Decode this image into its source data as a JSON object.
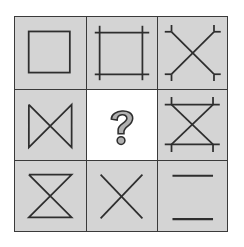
{
  "puzzle": {
    "type": "3x3 matrix reasoning",
    "colors": {
      "cell_bg": "#d4d4d4",
      "blank_bg": "#ffffff",
      "stroke": "#2e2e2e",
      "grid_line": "#3a3a3a",
      "qmark_fill": "#b0b0b0"
    },
    "cells": [
      {
        "row": 1,
        "col": 1,
        "figure": "square"
      },
      {
        "row": 1,
        "col": 2,
        "figure": "square-with-extended-sides"
      },
      {
        "row": 1,
        "col": 3,
        "figure": "x-with-forked-ends"
      },
      {
        "row": 2,
        "col": 1,
        "figure": "bowtie-vertical-sides"
      },
      {
        "row": 2,
        "col": 2,
        "figure": "question-mark",
        "label": "?"
      },
      {
        "row": 2,
        "col": 3,
        "figure": "hourglass-with-extended-bars"
      },
      {
        "row": 3,
        "col": 1,
        "figure": "hourglass"
      },
      {
        "row": 3,
        "col": 2,
        "figure": "x-cross"
      },
      {
        "row": 3,
        "col": 3,
        "figure": "two-horizontal-lines"
      }
    ],
    "missing_cell_label": "?"
  }
}
